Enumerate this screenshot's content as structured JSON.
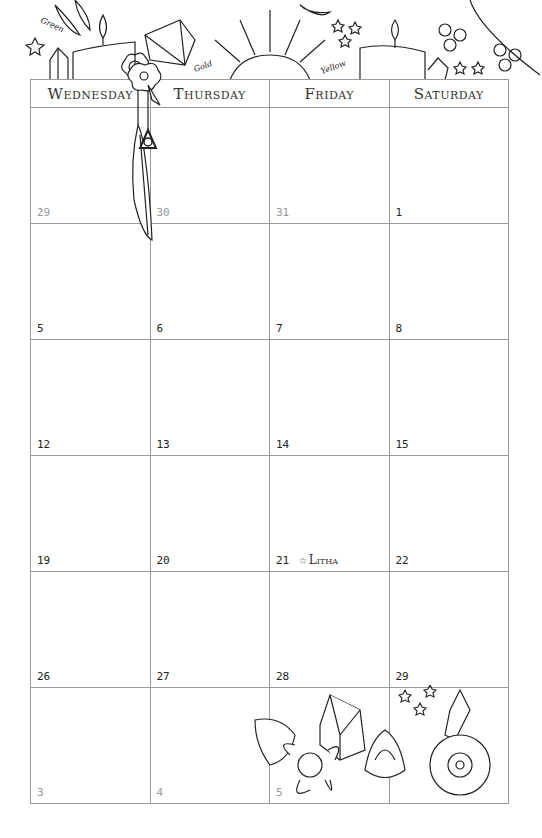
{
  "header": {
    "days": [
      "Wednesday",
      "Thursday",
      "Friday",
      "Saturday"
    ]
  },
  "decorations": {
    "color_labels": [
      "Green",
      "Gold",
      "Yellow"
    ]
  },
  "weeks": [
    [
      {
        "day": "29",
        "muted": true
      },
      {
        "day": "30",
        "muted": true
      },
      {
        "day": "31",
        "muted": true
      },
      {
        "day": "1",
        "muted": false
      }
    ],
    [
      {
        "day": "5",
        "muted": false
      },
      {
        "day": "6",
        "muted": false
      },
      {
        "day": "7",
        "muted": false
      },
      {
        "day": "8",
        "muted": false
      }
    ],
    [
      {
        "day": "12",
        "muted": false
      },
      {
        "day": "13",
        "muted": false
      },
      {
        "day": "14",
        "muted": false
      },
      {
        "day": "15",
        "muted": false
      }
    ],
    [
      {
        "day": "19",
        "muted": false
      },
      {
        "day": "20",
        "muted": false
      },
      {
        "day": "21",
        "muted": false,
        "event": "Litha",
        "event_icon": "star-icon"
      },
      {
        "day": "22",
        "muted": false
      }
    ],
    [
      {
        "day": "26",
        "muted": false
      },
      {
        "day": "27",
        "muted": false
      },
      {
        "day": "28",
        "muted": false
      },
      {
        "day": "29",
        "muted": false
      }
    ],
    [
      {
        "day": "3",
        "muted": true
      },
      {
        "day": "4",
        "muted": true
      },
      {
        "day": "5",
        "muted": true
      },
      {
        "day": "",
        "muted": true
      }
    ]
  ]
}
